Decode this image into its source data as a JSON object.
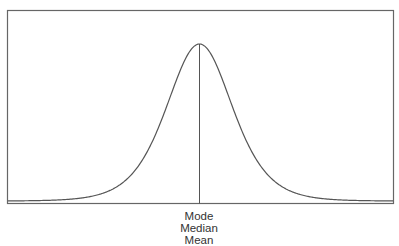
{
  "chart_data": {
    "type": "line",
    "title": "",
    "xlabel": "",
    "ylabel": "",
    "grid": false,
    "center_marker_labels": [
      "Mode",
      "Median",
      "Mean"
    ],
    "series": [
      {
        "name": "distribution",
        "shape": "symmetric-bell",
        "peak_x_fraction": 0.5,
        "peak_height_fraction": 0.83
      }
    ]
  },
  "labels": {
    "line1": "Mode",
    "line2": "Median",
    "line3": "Mean"
  },
  "colors": {
    "stroke": "#555555",
    "frame": "#666666",
    "text": "#333333"
  }
}
